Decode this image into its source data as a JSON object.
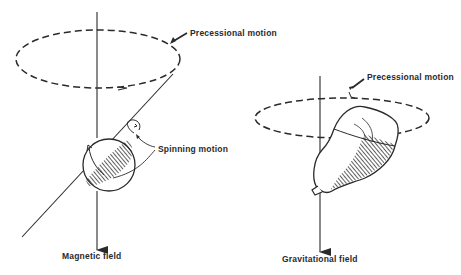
{
  "figure": {
    "left_panel": {
      "precession_label": "Precessional motion",
      "spin_label": "Spinning motion",
      "field_label": "Magnetic field"
    },
    "right_panel": {
      "precession_label": "Precessional motion",
      "field_label": "Gravitational field"
    }
  },
  "colors": {
    "ink": "#2a2a2a",
    "background": "#ffffff"
  }
}
